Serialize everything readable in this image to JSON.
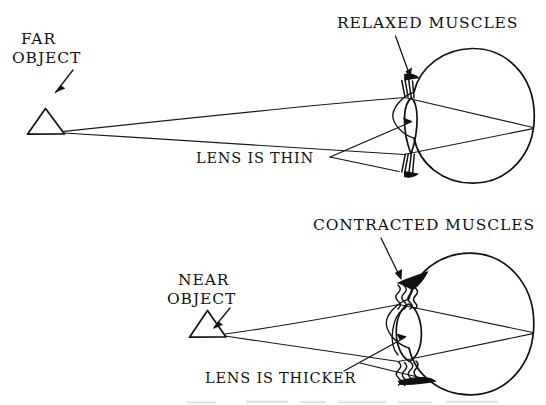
{
  "figure": {
    "style": "hand-drawn black ink line art on white paper",
    "width": 546,
    "height": 405,
    "ink_color": "#111111",
    "paper_color": "#ffffff"
  },
  "panels": [
    {
      "id": "far-object-panel",
      "name": "Far object accommodation",
      "object_label_line1": "FAR",
      "object_label_line2": "OBJECT",
      "muscle_label": "RELAXED MUSCLES",
      "lens_label": "LENS IS THIN",
      "object_shape": "triangle",
      "ray_count": 2,
      "lens_state": "thin",
      "muscle_state": "relaxed",
      "muscle_fiber_style": "straight taut fibers",
      "focus_point": "retina at back of eye"
    },
    {
      "id": "near-object-panel",
      "name": "Near object accommodation",
      "object_label_line1": "NEAR",
      "object_label_line2": "OBJECT",
      "muscle_label": "CONTRACTED MUSCLES",
      "lens_label": "LENS IS THICKER",
      "object_shape": "triangle",
      "ray_count": 2,
      "lens_state": "thick",
      "muscle_state": "contracted",
      "muscle_fiber_style": "wavy slackened fibers",
      "focus_point": "retina at back of eye"
    }
  ],
  "icons": {
    "arrow": "arrow-icon",
    "triangle": "triangle-object-icon",
    "eyeball": "eyeball-icon",
    "lens": "lens-icon"
  }
}
